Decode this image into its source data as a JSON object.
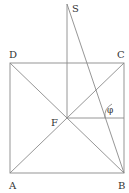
{
  "diagram": {
    "labels": {
      "S": "S",
      "D": "D",
      "C": "C",
      "F": "F",
      "A": "A",
      "B": "B",
      "angle": "φ"
    },
    "points": {
      "S": [
        67,
        4
      ],
      "D": [
        10,
        63
      ],
      "C": [
        124,
        63
      ],
      "A": [
        10,
        173
      ],
      "B": [
        124,
        173
      ],
      "F": [
        67,
        118
      ]
    },
    "line_color": "#8a8a8a",
    "label_color": "#333333"
  }
}
